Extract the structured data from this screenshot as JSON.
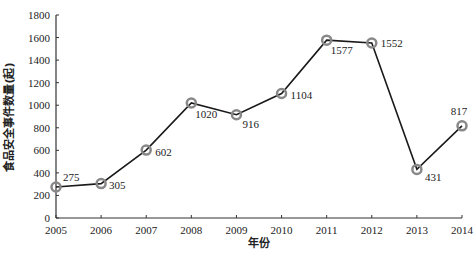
{
  "chart_data": {
    "type": "line",
    "title": "",
    "xlabel": "年份",
    "ylabel": "食品安全事件数量(起)",
    "categories": [
      "2005",
      "2006",
      "2007",
      "2008",
      "2009",
      "2010",
      "2011",
      "2012",
      "2013",
      "2014"
    ],
    "series": [
      {
        "name": "食品安全事件数量",
        "values": [
          275,
          305,
          602,
          1020,
          916,
          1104,
          1577,
          1552,
          431,
          817
        ]
      }
    ],
    "ylim": [
      0,
      1800
    ],
    "yticks": [
      0,
      200,
      400,
      600,
      800,
      1000,
      1200,
      1400,
      1600,
      1800
    ],
    "grid": false,
    "legend": "none",
    "marker": "circle",
    "colors": {
      "line": "#1a1a1a",
      "marker": "#888888"
    }
  }
}
